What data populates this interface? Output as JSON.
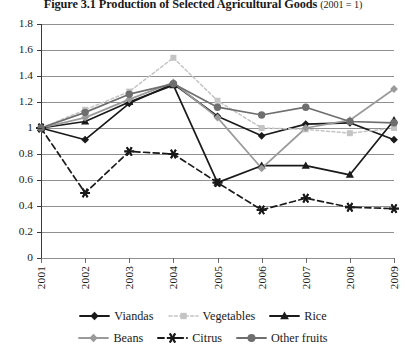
{
  "title": {
    "figure_number": "Figure 3.1",
    "text": "Production of Selected Agricultural Goods",
    "base_note": "(2001 = 1)",
    "full": "Figure 3.1 Production of Selected Agricultural Goods (2001 = 1)"
  },
  "axis": {
    "y_ticks": [
      "1.8",
      "1.6",
      "1.4",
      "1.2",
      "1",
      "0.8",
      "0.6",
      "0.4",
      "0.2",
      "0"
    ],
    "x_ticks": [
      "2001",
      "2002",
      "2003",
      "2004",
      "2005",
      "2006",
      "2007",
      "2008",
      "2009"
    ]
  },
  "legend": {
    "row1": [
      {
        "label": "Viandas",
        "marker": "diamond-marker",
        "color": "#1a1a1a",
        "dash": "solid"
      },
      {
        "label": "Vegetables",
        "marker": "square-marker",
        "color": "#c4c4c4",
        "dash": "dotted"
      },
      {
        "label": "Rice",
        "marker": "triangle-marker",
        "color": "#1a1a1a",
        "dash": "solid"
      }
    ],
    "row2": [
      {
        "label": "Beans",
        "marker": "diamond-marker",
        "color": "#9a9a9a",
        "dash": "solid"
      },
      {
        "label": "Citrus",
        "marker": "asterisk-marker",
        "color": "#1a1a1a",
        "dash": "dashed"
      },
      {
        "label": "Other fruits",
        "marker": "circle-marker",
        "color": "#6e6e6e",
        "dash": "solid"
      }
    ]
  },
  "chart_data": {
    "type": "line",
    "title": "Figure 3.1 Production of Selected Agricultural Goods (2001 = 1)",
    "xlabel": "",
    "ylabel": "",
    "ylim": [
      0,
      1.8
    ],
    "ytick_step": 0.2,
    "grid": true,
    "legend_position": "bottom",
    "x": [
      "2001",
      "2002",
      "2003",
      "2004",
      "2005",
      "2006",
      "2007",
      "2008",
      "2009"
    ],
    "series": [
      {
        "name": "Viandas",
        "color": "#1a1a1a",
        "marker": "diamond",
        "dash": "solid",
        "values": [
          1.0,
          0.91,
          1.19,
          1.34,
          1.09,
          0.94,
          1.03,
          1.04,
          0.91
        ]
      },
      {
        "name": "Vegetables",
        "color": "#c4c4c4",
        "marker": "square",
        "dash": "dotted",
        "values": [
          1.0,
          1.14,
          1.28,
          1.54,
          1.21,
          1.0,
          0.99,
          0.96,
          1.0
        ]
      },
      {
        "name": "Rice",
        "color": "#1a1a1a",
        "marker": "triangle",
        "dash": "solid",
        "values": [
          1.0,
          1.05,
          1.2,
          1.33,
          0.58,
          0.71,
          0.71,
          0.64,
          1.06
        ]
      },
      {
        "name": "Beans",
        "color": "#9a9a9a",
        "marker": "diamond",
        "dash": "solid",
        "values": [
          1.0,
          1.08,
          1.22,
          1.35,
          1.08,
          0.69,
          1.0,
          1.06,
          1.3
        ]
      },
      {
        "name": "Citrus",
        "color": "#1a1a1a",
        "marker": "asterisk",
        "dash": "dashed",
        "values": [
          1.0,
          0.5,
          0.82,
          0.8,
          0.58,
          0.37,
          0.46,
          0.39,
          0.38
        ]
      },
      {
        "name": "Other fruits",
        "color": "#6e6e6e",
        "marker": "circle",
        "dash": "solid",
        "values": [
          1.0,
          1.12,
          1.26,
          1.34,
          1.16,
          1.1,
          1.16,
          1.05,
          1.04
        ]
      }
    ]
  }
}
